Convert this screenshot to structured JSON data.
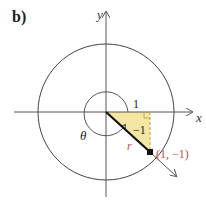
{
  "figure": {
    "part_label": "b)",
    "x_axis_label": "x",
    "y_axis_label": "y",
    "horizontal_leg_label": "1",
    "vertical_leg_label": "−1",
    "radius_label": "r",
    "angle_label": "θ",
    "point_label": "(1, −1)"
  },
  "colors": {
    "axis": "#555555",
    "circle": "#444444",
    "triangle_fill": "#f5e6a3",
    "accent": "#c0504d",
    "text": "#222222"
  }
}
